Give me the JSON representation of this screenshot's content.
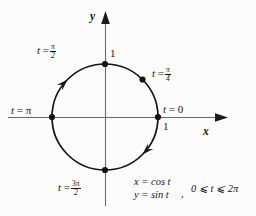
{
  "figure": {
    "background_color": "#fcfcfc",
    "ink_color": "#141417",
    "axis_color": "#5a5a5e"
  },
  "axes": {
    "x_label": "x",
    "y_label": "y",
    "origin": {
      "x": 105,
      "y": 117
    },
    "x_tick_label": "1",
    "y_tick_label": "1"
  },
  "circle": {
    "center": {
      "x": 105,
      "y": 117
    },
    "radius": 53,
    "stroke_color": "#141417",
    "stroke_width": 1.6,
    "orientation": "counterclockwise"
  },
  "points": [
    {
      "name": "t-zero",
      "label_t": "t",
      "label_eq": "=",
      "label_val": "0",
      "angle_deg": 0,
      "x": 158,
      "y": 117
    },
    {
      "name": "t-pi-over-4",
      "label_t": "t",
      "label_eq": "=",
      "label_val": "π/4",
      "angle_deg": 45,
      "x": 142,
      "y": 79
    },
    {
      "name": "t-pi-over-2",
      "label_t": "t",
      "label_eq": "=",
      "label_val": "π/2",
      "angle_deg": 90,
      "x": 105,
      "y": 64
    },
    {
      "name": "t-pi",
      "label_t": "t",
      "label_eq": "=",
      "label_val": "π",
      "angle_deg": 180,
      "x": 52,
      "y": 117
    },
    {
      "name": "t-3pi-over-2",
      "label_t": "t",
      "label_eq": "=",
      "label_val": "3π/2",
      "angle_deg": 270,
      "x": 105,
      "y": 170
    }
  ],
  "labels": {
    "t_zero": {
      "t": "t",
      "eq": "=",
      "value": "0"
    },
    "t_pi_4": {
      "t": "t",
      "eq": "=",
      "num": "π",
      "den": "4"
    },
    "t_pi_2": {
      "t": "t",
      "eq": "=",
      "num": "π",
      "den": "2"
    },
    "t_pi": {
      "t": "t",
      "eq": "=",
      "value": "π"
    },
    "t_3pi_2": {
      "t": "t",
      "eq": "=",
      "num": "3π",
      "den": "2"
    },
    "tick_x_one": "1",
    "tick_y_one": "1"
  },
  "equations": {
    "x_eq": "x = cos t",
    "y_eq": "y = sin t",
    "separator": ",",
    "domain": "0 ⩽ t ⩽ 2π"
  },
  "direction_arrows": [
    {
      "name": "arrow-upper-left",
      "at_angle_deg": 135,
      "points": "counterclockwise"
    },
    {
      "name": "arrow-lower-right",
      "at_angle_deg": 315,
      "points": "counterclockwise"
    }
  ]
}
